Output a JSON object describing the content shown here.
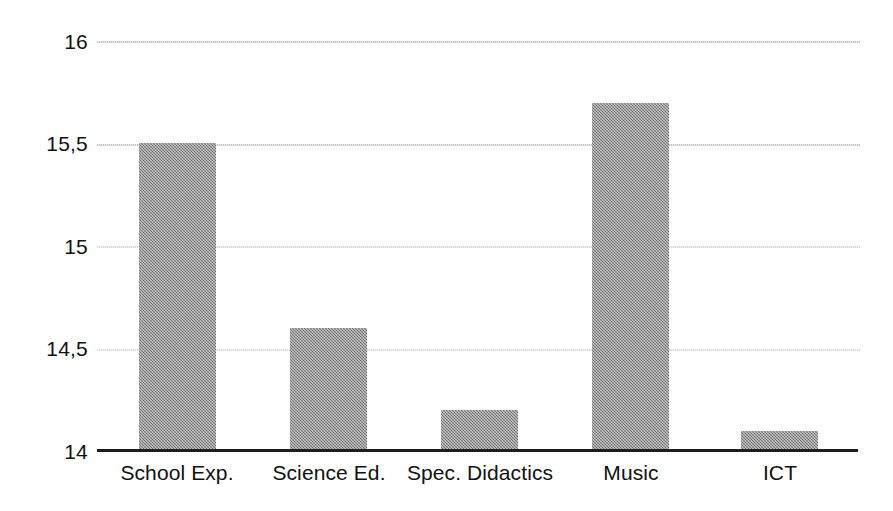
{
  "chart_data": {
    "type": "bar",
    "title": "",
    "subtitle": "",
    "xlabel": "",
    "ylabel": "",
    "categories": [
      "School Exp.",
      "Science Ed.",
      "Spec. Didactics",
      "Music",
      "ICT"
    ],
    "values": [
      15.5,
      14.6,
      14.2,
      15.7,
      14.1
    ],
    "value_labels": [
      "15,5",
      "14,6",
      "14,2",
      "15,7",
      "14,1"
    ],
    "series": [
      {
        "name": "",
        "values": [
          15.5,
          14.6,
          14.2,
          15.7,
          14.1
        ]
      }
    ],
    "ylim": [
      14,
      16
    ],
    "yticks": [
      14,
      14.5,
      15,
      15.5,
      16
    ],
    "ytick_labels": [
      "14",
      "14,5",
      "15",
      "15,5",
      "16"
    ],
    "decimal_separator": ",",
    "grid": true,
    "grid_axis": "y",
    "legend": false,
    "legend_position": "none",
    "annotations": [],
    "colors": {
      "bar_fill": "#8d8d8d",
      "gridline": "#b9b9b9",
      "axis": "#1d1d1d",
      "text": "#111111",
      "background": "#ffffff"
    }
  },
  "axis": {
    "y_ticks": [
      {
        "label": "16",
        "value": 16
      },
      {
        "label": "15,5",
        "value": 15.5
      },
      {
        "label": "15",
        "value": 15
      },
      {
        "label": "14,5",
        "value": 14.5
      },
      {
        "label": "14",
        "value": 14
      }
    ],
    "x_categories": [
      {
        "label": "School Exp."
      },
      {
        "label": "Science Ed."
      },
      {
        "label": "Spec. Didactics"
      },
      {
        "label": "Music"
      },
      {
        "label": "ICT"
      }
    ]
  },
  "bars": [
    {
      "category": "School Exp.",
      "value": 15.5
    },
    {
      "category": "Science Ed.",
      "value": 14.6
    },
    {
      "category": "Spec. Didactics",
      "value": 14.2
    },
    {
      "category": "Music",
      "value": 15.7
    },
    {
      "category": "ICT",
      "value": 14.1
    }
  ]
}
